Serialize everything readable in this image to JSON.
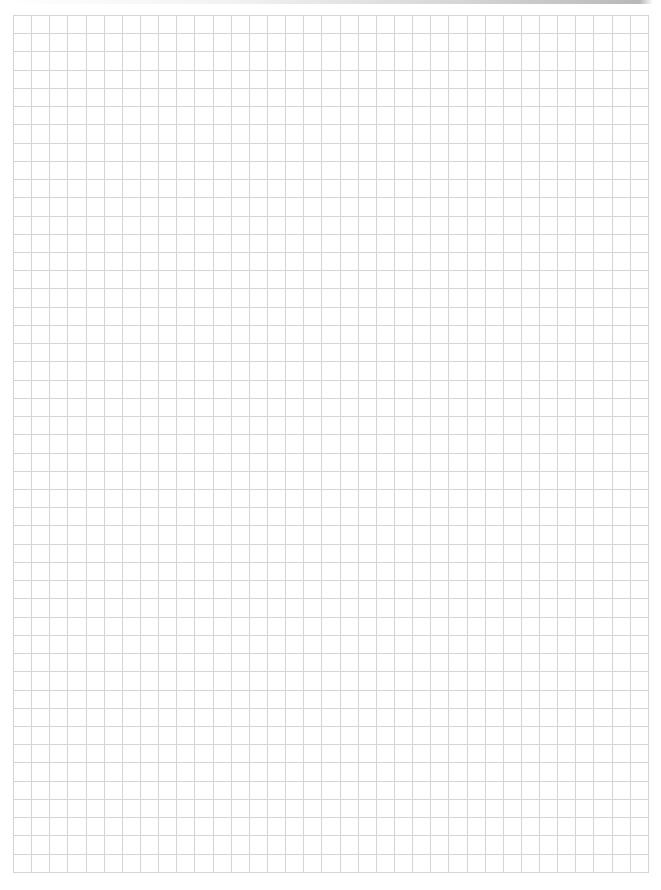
{
  "page": {
    "background_color": "#ffffff",
    "line_color": "#d4d4d4"
  },
  "grid": {
    "left": 13,
    "top": 15,
    "columns": 35,
    "rows": 47,
    "cell_width": 18.14,
    "cell_height": 18.23
  }
}
